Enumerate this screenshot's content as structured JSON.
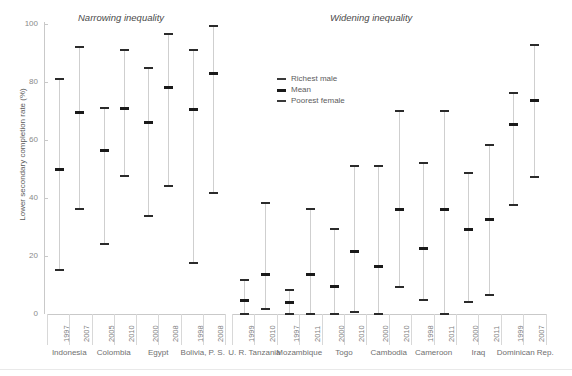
{
  "chart_data": {
    "type": "bar",
    "title": "",
    "xlabel": "",
    "ylabel": "Lower secondary completion rate (%)",
    "ylim": [
      0,
      100
    ],
    "yticks": [
      0,
      20,
      40,
      60,
      80,
      100
    ],
    "grid": false,
    "legend_position": "upper-center-right",
    "panel_titles": [
      "Narrowing inequality",
      "Widening inequality"
    ],
    "series": [
      {
        "name": "Richest male"
      },
      {
        "name": "Mean"
      },
      {
        "name": "Poorest female"
      }
    ],
    "panels": [
      {
        "label": "Narrowing inequality",
        "groups": [
          {
            "country": "Indonesia",
            "points": [
              {
                "year": "1997",
                "richest_male": 81,
                "mean": 50,
                "poorest_female": 15
              },
              {
                "year": "2007",
                "richest_male": 92,
                "mean": 69.5,
                "poorest_female": 36
              }
            ]
          },
          {
            "country": "Colombia",
            "points": [
              {
                "year": "2005",
                "richest_male": 71,
                "mean": 56.5,
                "poorest_female": 24
              },
              {
                "year": "2010",
                "richest_male": 91,
                "mean": 71,
                "poorest_female": 47.5
              }
            ]
          },
          {
            "country": "Egypt",
            "points": [
              {
                "year": "2000",
                "richest_male": 84.5,
                "mean": 66,
                "poorest_female": 33.5
              },
              {
                "year": "2008",
                "richest_male": 96.5,
                "mean": 78,
                "poorest_female": 44
              }
            ]
          },
          {
            "country": "Bolivia, P. S.",
            "points": [
              {
                "year": "1998",
                "richest_male": 91,
                "mean": 70.5,
                "poorest_female": 17.5
              },
              {
                "year": "2008",
                "richest_male": 99,
                "mean": 83,
                "poorest_female": 41.5
              }
            ]
          }
        ]
      },
      {
        "label": "Widening inequality",
        "groups": [
          {
            "country": "U. R. Tanzania",
            "points": [
              {
                "year": "1999",
                "richest_male": 11.5,
                "mean": 4.5,
                "poorest_female": 0
              },
              {
                "year": "2010",
                "richest_male": 38,
                "mean": 13.5,
                "poorest_female": 1.5
              }
            ]
          },
          {
            "country": "Mozambique",
            "points": [
              {
                "year": "1997",
                "richest_male": 8,
                "mean": 4,
                "poorest_female": 0
              },
              {
                "year": "2011",
                "richest_male": 36,
                "mean": 13.5,
                "poorest_female": 0
              }
            ]
          },
          {
            "country": "Togo",
            "points": [
              {
                "year": "2000",
                "richest_male": 29,
                "mean": 9.5,
                "poorest_female": 0
              },
              {
                "year": "2010",
                "richest_male": 51,
                "mean": 21.5,
                "poorest_female": 0.5
              }
            ]
          },
          {
            "country": "Cambodia",
            "points": [
              {
                "year": "2000",
                "richest_male": 51,
                "mean": 16.5,
                "poorest_female": 0
              },
              {
                "year": "2010",
                "richest_male": 70,
                "mean": 36,
                "poorest_female": 9
              }
            ]
          },
          {
            "country": "Cameroon",
            "points": [
              {
                "year": "1998",
                "richest_male": 52,
                "mean": 22.5,
                "poorest_female": 4.5
              },
              {
                "year": "2011",
                "richest_male": 70,
                "mean": 36,
                "poorest_female": 0
              }
            ]
          },
          {
            "country": "Iraq",
            "points": [
              {
                "year": "2000",
                "richest_male": 48.5,
                "mean": 29,
                "poorest_female": 4
              },
              {
                "year": "2011",
                "richest_male": 58,
                "mean": 32.5,
                "poorest_female": 6.5
              }
            ]
          },
          {
            "country": "Dominican Rep.",
            "points": [
              {
                "year": "1999",
                "richest_male": 76,
                "mean": 65.5,
                "poorest_female": 37.5
              },
              {
                "year": "2007",
                "richest_male": 92.5,
                "mean": 73.5,
                "poorest_female": 47
              }
            ]
          }
        ]
      }
    ]
  },
  "colors": {
    "mark": "#2b2b2b",
    "mean_mark": "#1a1a1a",
    "stem": "#cfcfcf",
    "axis": "#c9c9c9",
    "tick_text": "#8a8a8a",
    "label_text": "#6f6f6f"
  }
}
